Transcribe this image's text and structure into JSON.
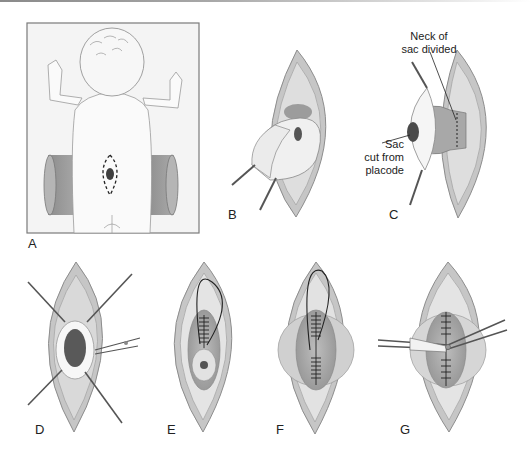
{
  "figure": {
    "panels": [
      {
        "id": "A",
        "label": "A",
        "description": "infant prone with bolsters, dashed incision around lesion"
      },
      {
        "id": "B",
        "label": "B",
        "description": "sac dissected and lifted with forceps"
      },
      {
        "id": "C",
        "label": "C",
        "description": "neck of sac divided; sac cut from placode"
      },
      {
        "id": "D",
        "label": "D",
        "description": "placode exposed with stay sutures and scissors"
      },
      {
        "id": "E",
        "label": "E",
        "description": "neural tube closure with running suture"
      },
      {
        "id": "F",
        "label": "F",
        "description": "dural closure with running suture"
      },
      {
        "id": "G",
        "label": "G",
        "description": "fascial closure with scissors"
      }
    ],
    "annotations": {
      "neck_line1": "Neck of",
      "neck_line2": "sac divided",
      "sac_line1": "Sac",
      "sac_line2": "cut from",
      "sac_line3": "placode"
    },
    "colors": {
      "skin_outer": "#c8c8c8",
      "tissue_mid": "#d9d9d9",
      "tissue_inner": "#ececec",
      "placode": "#555555",
      "bolster": "#9a9a9a",
      "panel_border": "#7a7a7a"
    }
  }
}
